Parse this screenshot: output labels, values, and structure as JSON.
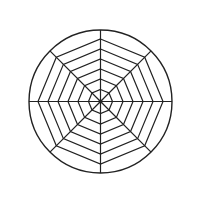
{
  "canvas": {
    "width": 201,
    "height": 204,
    "background": "#ffffff"
  },
  "chart_data": {
    "type": "radar",
    "title": "",
    "center_x": 100.5,
    "center_y": 101.5,
    "outer_circle_radius": 71.5,
    "ring_shape": "octagon",
    "ring_radii": [
      12,
      22.5,
      32.5,
      42.5,
      52.5,
      62.5
    ],
    "num_spokes": 8,
    "spoke_angles_deg": [
      -90,
      -45,
      0,
      45,
      90,
      135,
      180,
      225
    ],
    "spoke_length": 71.5,
    "center_dot_radius": 2,
    "stroke_color": "#222222",
    "stroke_width": 1.2,
    "outer_stroke_width": 1.4,
    "series": [],
    "axis_labels": [],
    "tick_labels": [],
    "legend": null,
    "grid": "on"
  }
}
